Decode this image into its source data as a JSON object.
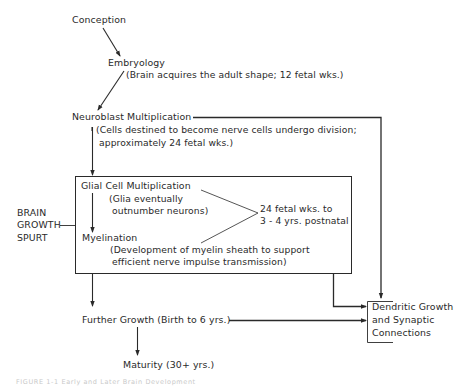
{
  "diagram": {
    "nodes": {
      "conception": "Conception",
      "embryology": {
        "title": "Embryology",
        "note": "(Brain acquires the adult shape; 12 fetal wks.)"
      },
      "neuroblast": {
        "title": "Neuroblast Multiplication",
        "note_line1": "(Cells destined to become nerve cells undergo division;",
        "note_line2": "approximately 24 fetal wks.)"
      },
      "glial": {
        "title": "Glial Cell Multiplication",
        "note_line1": "(Glia eventually",
        "note_line2": "outnumber neurons)"
      },
      "myelination": {
        "title": "Myelination",
        "note_line1": "(Development of myelin sheath to support",
        "note_line2": "efficient nerve impulse transmission)"
      },
      "timespan": {
        "line1": "24 fetal wks. to",
        "line2": "3 - 4 yrs. postnatal"
      },
      "brain_growth_spurt": {
        "line1": "BRAIN",
        "line2": "GROWTH",
        "line3": "SPURT"
      },
      "further_growth": "Further Growth (Birth to 6 yrs.)",
      "maturity": "Maturity (30+ yrs.)",
      "dendritic": {
        "line1": "Dendritic Growth",
        "line2": "and Synaptic",
        "line3": "Connections"
      }
    },
    "edges": [
      {
        "from": "Conception",
        "to": "Embryology"
      },
      {
        "from": "Embryology",
        "to": "Neuroblast Multiplication"
      },
      {
        "from": "Neuroblast Multiplication",
        "to": "Glial Cell Multiplication"
      },
      {
        "from": "Glial Cell Multiplication",
        "to": "Myelination"
      },
      {
        "from": "Neuroblast Multiplication",
        "to": "Dendritic Growth and Synaptic Connections"
      },
      {
        "from": "Brain Growth Spurt box",
        "to": "Further Growth"
      },
      {
        "from": "Brain Growth Spurt box",
        "to": "Dendritic Growth and Synaptic Connections"
      },
      {
        "from": "Further Growth",
        "to": "Dendritic Growth and Synaptic Connections"
      },
      {
        "from": "Further Growth",
        "to": "Maturity"
      }
    ],
    "caption": "FIGURE 1-1  Early and Later Brain Development"
  },
  "colors": {
    "ink": "#2a2a2a",
    "caption": "#c9c9c9",
    "background": "#ffffff"
  }
}
